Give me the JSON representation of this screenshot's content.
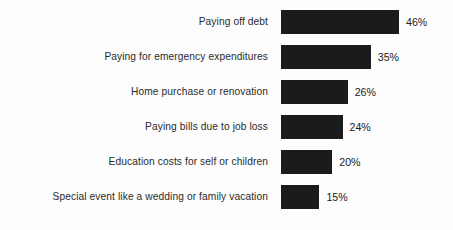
{
  "chart_data": {
    "type": "bar",
    "orientation": "horizontal",
    "title": "",
    "subtitle": "",
    "xlabel": "",
    "ylabel": "",
    "xlim": [
      0,
      50
    ],
    "grid": false,
    "legend": false,
    "bar_color": "#1b1b1b",
    "background_color": "#fdfdfd",
    "label_color": "#2b2b2b",
    "value_suffix": "%",
    "categories": [
      "Paying off debt",
      "Paying for emergency expenditures",
      "Home purchase or renovation",
      "Paying bills due to job loss",
      "Education costs for self or children",
      "Special event like a wedding or family vacation"
    ],
    "values": [
      46,
      35,
      26,
      24,
      20,
      15
    ],
    "value_labels": [
      "46%",
      "35%",
      "26%",
      "24%",
      "20%",
      "15%"
    ],
    "rows": [
      {
        "label": "Paying off debt",
        "value": 46,
        "value_label": "46%"
      },
      {
        "label": "Paying for emergency expenditures",
        "value": 35,
        "value_label": "35%"
      },
      {
        "label": "Home purchase or renovation",
        "value": 26,
        "value_label": "26%"
      },
      {
        "label": "Paying bills due to job loss",
        "value": 24,
        "value_label": "24%"
      },
      {
        "label": "Education costs for self or children",
        "value": 20,
        "value_label": "20%"
      },
      {
        "label": "Special event like a wedding or family vacation",
        "value": 15,
        "value_label": "15%"
      }
    ]
  }
}
